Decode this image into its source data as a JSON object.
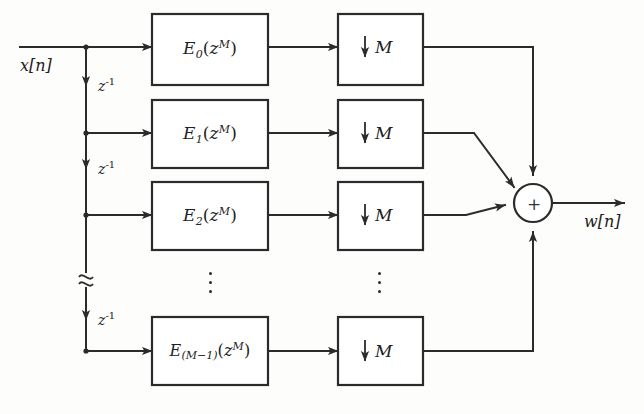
{
  "figure": {
    "ink_color": "#2b2b2b",
    "background_color": "#fdfdfc"
  },
  "signals": {
    "input": "x[n]",
    "output": "w[n]"
  },
  "delay_chain": {
    "label": "z",
    "exponent": "-1",
    "taps": [
      {
        "name": "delay-1",
        "label": "z",
        "exponent": "-1"
      },
      {
        "name": "delay-2",
        "label": "z",
        "exponent": "-1"
      },
      {
        "name": "delay-3",
        "label": "z",
        "exponent": "-1"
      }
    ],
    "break_symbol": "≈"
  },
  "branches": [
    {
      "index": 0,
      "polyphase": {
        "base": "E",
        "sub": "0",
        "arg_open": "(",
        "var": "z",
        "sup": "M",
        "arg_close": ")"
      },
      "downsampler": {
        "arrow": "↓",
        "factor": "M"
      }
    },
    {
      "index": 1,
      "polyphase": {
        "base": "E",
        "sub": "1",
        "arg_open": "(",
        "var": "z",
        "sup": "M",
        "arg_close": ")"
      },
      "downsampler": {
        "arrow": "↓",
        "factor": "M"
      }
    },
    {
      "index": 2,
      "polyphase": {
        "base": "E",
        "sub": "2",
        "arg_open": "(",
        "var": "z",
        "sup": "M",
        "arg_close": ")"
      },
      "downsampler": {
        "arrow": "↓",
        "factor": "M"
      }
    },
    {
      "index": 3,
      "polyphase": {
        "base": "E",
        "sub": "(M−1)",
        "arg_open": "(",
        "var": "z",
        "sup": "M",
        "arg_close": ")"
      },
      "downsampler": {
        "arrow": "↓",
        "factor": "M"
      }
    }
  ],
  "adder": {
    "symbol": "+",
    "name": "summing-junction"
  },
  "ellipsis": {
    "symbol": "⋮",
    "columns": [
      "polyphase-column",
      "downsampler-column"
    ]
  }
}
